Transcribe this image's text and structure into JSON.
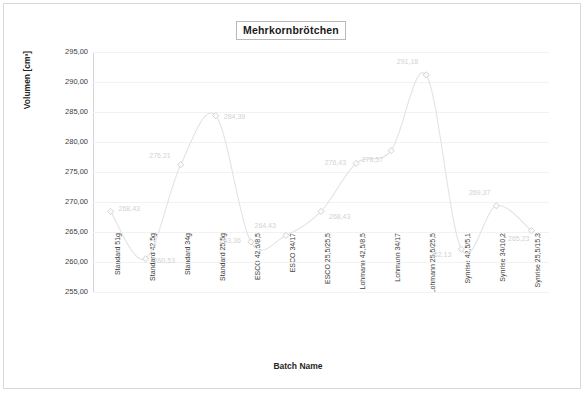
{
  "chart_data": {
    "type": "line",
    "title": "Mehrkornbrötchen",
    "xlabel": "Batch Name",
    "ylabel": "Volumen [cm³]",
    "ylim": [
      255.0,
      295.0
    ],
    "ytick_step": 5.0,
    "ytick_labels": [
      "295,00",
      "290,00",
      "285,00",
      "280,00",
      "275,00",
      "270,00",
      "265,00",
      "260,00",
      "255,00"
    ],
    "ytick_values": [
      295.0,
      290.0,
      285.0,
      280.0,
      275.0,
      270.0,
      265.0,
      260.0,
      255.0
    ],
    "grid": true,
    "legend": "none",
    "marker": "diamond",
    "line_style": "smooth",
    "categories": [
      "Standard 51g",
      "Standard 42,5g",
      "Standard 34g",
      "Standard 25,5g",
      "ESCO 42,5/8,5",
      "ESCO 34/17",
      "ESCO 25,5/25,5",
      "Lohmann 42,5/8,5",
      "Lohmann 34/17",
      "Lohmann 25,5/25,5",
      "Synrise 42,5/5,1",
      "Synrise 34/10,2",
      "Synrise 25,5/15,3"
    ],
    "values": [
      268.43,
      260.53,
      276.21,
      284.39,
      263.36,
      264.43,
      268.43,
      276.43,
      278.57,
      291.18,
      262.13,
      269.37,
      265.23
    ],
    "point_labels": [
      "268,43",
      "260,53",
      "276,21",
      "284,39",
      "263,36",
      "264,43",
      "268,43",
      "276,43",
      "278,57",
      "291,18",
      "262,13",
      "269,37",
      "265,23"
    ],
    "series": [
      {
        "name": "Volumen",
        "values": [
          268.43,
          260.53,
          276.21,
          284.39,
          263.36,
          264.43,
          268.43,
          276.43,
          278.57,
          291.18,
          262.13,
          269.37,
          265.23
        ]
      }
    ],
    "colors": {
      "line": "#e3e3e3",
      "marker": "#cfcfcf",
      "grid": "#f2f2f2",
      "text": "#3d3d3d",
      "label": "#d2d2d2",
      "border": "#d8d8d8"
    }
  }
}
